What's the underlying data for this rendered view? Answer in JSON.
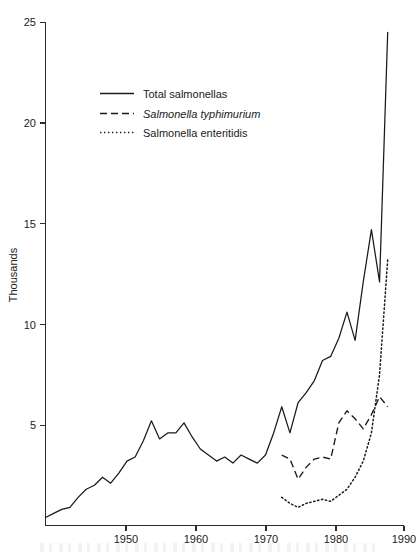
{
  "chart_data": {
    "type": "line",
    "title": "",
    "subtitle": "",
    "xlabel": "",
    "ylabel": "Thousands",
    "xlim": [
      1946,
      1990
    ],
    "ylim": [
      0,
      25
    ],
    "grid": false,
    "legend_position": "upper-left-inside",
    "y_ticks": [
      5,
      10,
      15,
      20,
      25
    ],
    "y_tick_labels": [
      "5",
      "10",
      "15",
      "20",
      "25"
    ],
    "x_ticks": [
      1950,
      1960,
      1970,
      1980,
      1990
    ],
    "x_tick_labels": [
      "1950",
      "1960",
      "1970",
      "1980",
      "1990"
    ],
    "series": [
      {
        "name": "Total salmonellas",
        "style": "solid",
        "x": [
          1946,
          1947,
          1948,
          1949,
          1950,
          1951,
          1952,
          1953,
          1954,
          1955,
          1956,
          1957,
          1958,
          1959,
          1960,
          1961,
          1962,
          1963,
          1964,
          1965,
          1966,
          1967,
          1968,
          1969,
          1970,
          1971,
          1972,
          1973,
          1974,
          1975,
          1976,
          1977,
          1978,
          1979,
          1980,
          1981,
          1982,
          1983,
          1984,
          1985,
          1986,
          1987,
          1988
        ],
        "values": [
          0.4,
          0.6,
          0.8,
          0.9,
          1.4,
          1.8,
          2.0,
          2.4,
          2.1,
          2.6,
          3.2,
          3.4,
          4.2,
          5.2,
          4.3,
          4.6,
          4.6,
          5.1,
          4.4,
          3.8,
          3.5,
          3.2,
          3.4,
          3.1,
          3.5,
          3.3,
          3.1,
          3.5,
          4.6,
          5.9,
          4.6,
          6.1,
          6.6,
          7.2,
          8.2,
          8.4,
          9.3,
          10.6,
          9.2,
          12.1,
          14.7,
          12.1,
          24.5
        ]
      },
      {
        "name": "Salmonella typhimurium",
        "style": "dashed",
        "x": [
          1975,
          1976,
          1977,
          1978,
          1979,
          1980,
          1981,
          1982,
          1983,
          1984,
          1985,
          1986,
          1987,
          1988
        ],
        "values": [
          3.5,
          3.3,
          2.3,
          2.9,
          3.3,
          3.4,
          3.3,
          5.1,
          5.7,
          5.3,
          4.8,
          5.5,
          6.4,
          5.9
        ]
      },
      {
        "name": "Salmonella enteritidis",
        "style": "dotted",
        "x": [
          1975,
          1976,
          1977,
          1978,
          1979,
          1980,
          1981,
          1982,
          1983,
          1984,
          1985,
          1986,
          1987,
          1988
        ],
        "values": [
          1.4,
          1.1,
          0.9,
          1.1,
          1.2,
          1.3,
          1.2,
          1.5,
          1.8,
          2.4,
          3.2,
          4.6,
          7.5,
          13.2
        ]
      }
    ]
  },
  "legend": {
    "items": [
      {
        "label": "Total salmonellas",
        "style": "solid",
        "italic": false
      },
      {
        "label": "Salmonella typhimurium",
        "style": "dashed",
        "italic": true
      },
      {
        "label": "Salmonella enteritidis",
        "style": "dotted",
        "italic": false
      }
    ]
  },
  "axes": {
    "y_title": "Thousands"
  },
  "colors": {
    "ink": "#1a1a1a",
    "axis": "#2b2b2b",
    "background": "#ffffff"
  }
}
